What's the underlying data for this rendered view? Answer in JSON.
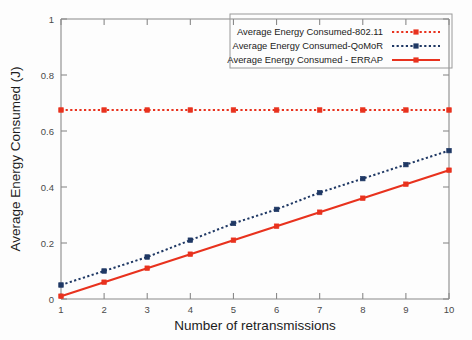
{
  "chart_data": {
    "type": "line",
    "title": "",
    "xlabel": "Number of retransmissions",
    "ylabel": "Average Energy Consumed (J)",
    "x": [
      1,
      2,
      3,
      4,
      5,
      6,
      7,
      8,
      9,
      10
    ],
    "xlim": [
      1,
      10
    ],
    "ylim": [
      0,
      1
    ],
    "xticks": [
      "1",
      "2",
      "3",
      "4",
      "5",
      "6",
      "7",
      "8",
      "9",
      "10"
    ],
    "yticks": [
      "0",
      "0.2",
      "0.4",
      "0.6",
      "0.8",
      "1"
    ],
    "ytick_values": [
      0,
      0.2,
      0.4,
      0.6,
      0.8,
      1
    ],
    "grid": false,
    "legend_position": "top-right",
    "series": [
      {
        "name": "Average Energy Consumed-802.11",
        "color": "#E8321E",
        "style": "dotted",
        "marker": "square",
        "values": [
          0.675,
          0.675,
          0.675,
          0.675,
          0.675,
          0.675,
          0.675,
          0.675,
          0.675,
          0.675
        ]
      },
      {
        "name": "Average Energy Consumed-QoMoR",
        "color": "#1F3864",
        "style": "dotted",
        "marker": "square",
        "values": [
          0.05,
          0.1,
          0.15,
          0.21,
          0.27,
          0.32,
          0.38,
          0.43,
          0.48,
          0.53
        ]
      },
      {
        "name": "Average Energy Consumed - ERRAP",
        "color": "#E8321E",
        "style": "solid",
        "marker": "square",
        "values": [
          0.01,
          0.06,
          0.11,
          0.16,
          0.21,
          0.26,
          0.31,
          0.36,
          0.41,
          0.46
        ]
      }
    ]
  },
  "colors": {
    "background": "#fdfdfd",
    "axis": "#8a8a8a",
    "text": "#1c1c1c",
    "series_red": "#E8321E",
    "series_navy": "#1F3864"
  }
}
